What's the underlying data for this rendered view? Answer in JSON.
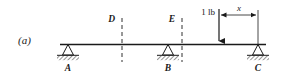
{
  "figure": {
    "panel_label": "(a)",
    "type": "beam-free-body-diagram"
  },
  "beam": {
    "color": "#1a1a1a"
  },
  "supports": [
    {
      "id": "A",
      "label": "A",
      "kind": "pin-support",
      "x": 68
    },
    {
      "id": "B",
      "label": "B",
      "kind": "pin-support",
      "x": 168
    },
    {
      "id": "C",
      "label": "C",
      "kind": "pin-support",
      "x": 258
    }
  ],
  "section_lines": [
    {
      "id": "D",
      "label": "D",
      "x": 122
    },
    {
      "id": "E",
      "label": "E",
      "x": 182
    }
  ],
  "load": {
    "label": "1 lb",
    "direction": "down",
    "x": 219
  },
  "dimension": {
    "label": "x",
    "from_x": 219,
    "to_x": 258
  }
}
